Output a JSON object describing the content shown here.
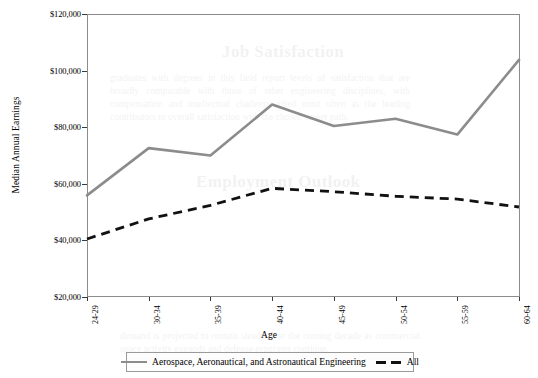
{
  "chart_data": {
    "type": "line",
    "title": "",
    "xlabel": "Age",
    "ylabel": "Median Annual Earnings",
    "categories": [
      "24-29",
      "30-34",
      "35-39",
      "40-44",
      "45-49",
      "50-54",
      "55-59",
      "60-64"
    ],
    "ylim": [
      20000,
      120000
    ],
    "ytick_values": [
      20000,
      40000,
      60000,
      80000,
      100000,
      120000
    ],
    "ytick_labels": [
      "$20,000",
      "$40,000",
      "$60,000",
      "$80,000",
      "$100,000",
      "$120,000"
    ],
    "grid": false,
    "legend_position": "bottom",
    "series": [
      {
        "name": "Aerospace, Aeronautical, and Astronautical Engineering",
        "style": "solid",
        "color": "#8c8c8c",
        "values": [
          55900,
          72600,
          70000,
          88000,
          80400,
          83000,
          77400,
          103800
        ]
      },
      {
        "name": "All",
        "style": "dashed",
        "color": "#111111",
        "values": [
          40500,
          47600,
          52400,
          58400,
          57200,
          55600,
          54600,
          51800
        ]
      }
    ]
  },
  "legend": {
    "entries": [
      {
        "label": "Aerospace, Aeronautical, and Astronautical Engineering"
      },
      {
        "label": "All"
      }
    ]
  },
  "ghost": {
    "heading_1": "Job Satisfaction",
    "heading_2": "Employment Outlook",
    "para_1": "graduates with degrees in this field report levels of satisfaction that are broadly comparable with those of other engineering disciplines, with compensation and intellectual challenge cited most often as the leading contributors to overall satisfaction with the chosen career path.",
    "para_2": "demand is projected to remain steady over the coming decade as commercial space activity expands and defense programs continue."
  }
}
